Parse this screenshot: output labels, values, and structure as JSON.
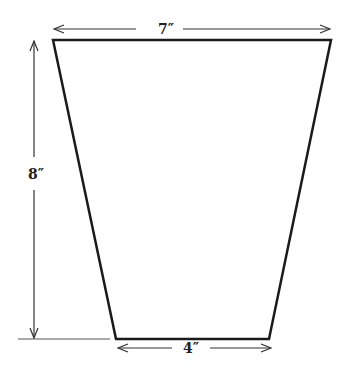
{
  "diagram": {
    "shape": "trapezoid",
    "colors": {
      "stroke": "#1a1a1a",
      "dimension": "#333333",
      "background": "#ffffff"
    },
    "dimensions": {
      "top_width": "7″",
      "height": "8″",
      "bottom_width": "4″"
    }
  }
}
